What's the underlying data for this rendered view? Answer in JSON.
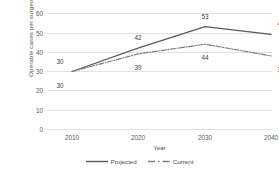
{
  "chart_data": {
    "type": "line",
    "title": "",
    "xlabel": "Year",
    "ylabel": "Operable cases per surgeon",
    "categories": [
      "2010",
      "2020",
      "2030",
      "2040"
    ],
    "ylim": [
      0,
      60
    ],
    "yticks": [
      "0",
      "10",
      "20",
      "30",
      "40",
      "50",
      "60"
    ],
    "grid": true,
    "legend_position": "bottom-center",
    "series": [
      {
        "name": "Projected",
        "values": [
          30,
          42,
          53,
          49
        ],
        "style": "solid",
        "color": "#595959",
        "label_offsets": [
          -11,
          -11,
          -11,
          -11
        ]
      },
      {
        "name": "Current",
        "values": [
          30,
          39,
          44,
          38
        ],
        "style": "dash-dot",
        "color": "#7f7f7f",
        "label_offsets": [
          13,
          13,
          13,
          13
        ]
      }
    ]
  },
  "colors": {
    "gridline": "#e2e2e2",
    "axis_text": "#5a5a5a",
    "data_label": "#3d3d3d",
    "background": "#ffffff"
  }
}
